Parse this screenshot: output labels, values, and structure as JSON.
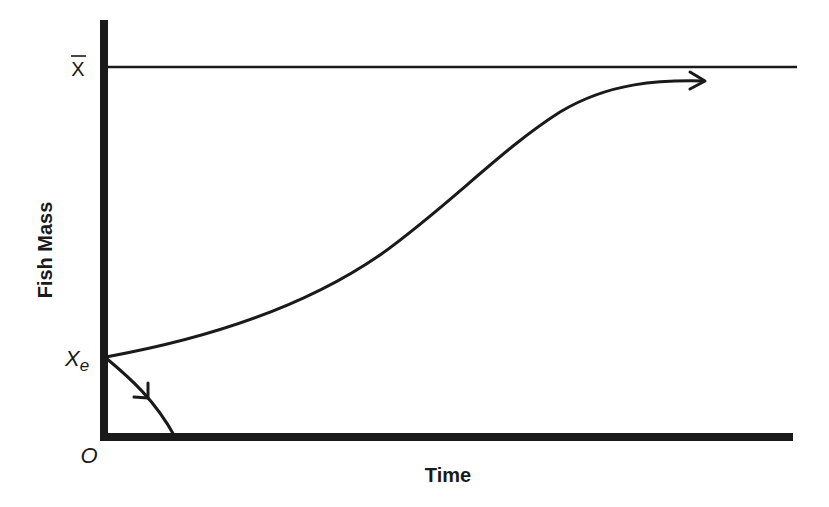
{
  "diagram": {
    "y_axis_title": "Fish Mass",
    "x_axis_title": "Time",
    "labels": {
      "x_bar": "X",
      "x_e_main": "X",
      "x_e_sub": "e",
      "origin": "O"
    },
    "elements": [
      {
        "id": "upper-asymptote",
        "type": "horizontal-line",
        "label": "X̄ (carrying capacity)"
      },
      {
        "id": "growth-trajectory",
        "type": "arrow-curve",
        "description": "S-shaped curve from Xe rising toward X̄"
      },
      {
        "id": "decline-trajectory",
        "type": "arrow-curve",
        "description": "Curve from Xe declining to zero"
      }
    ],
    "colors": {
      "ink": "#1a1a1a",
      "background": "#ffffff"
    }
  }
}
